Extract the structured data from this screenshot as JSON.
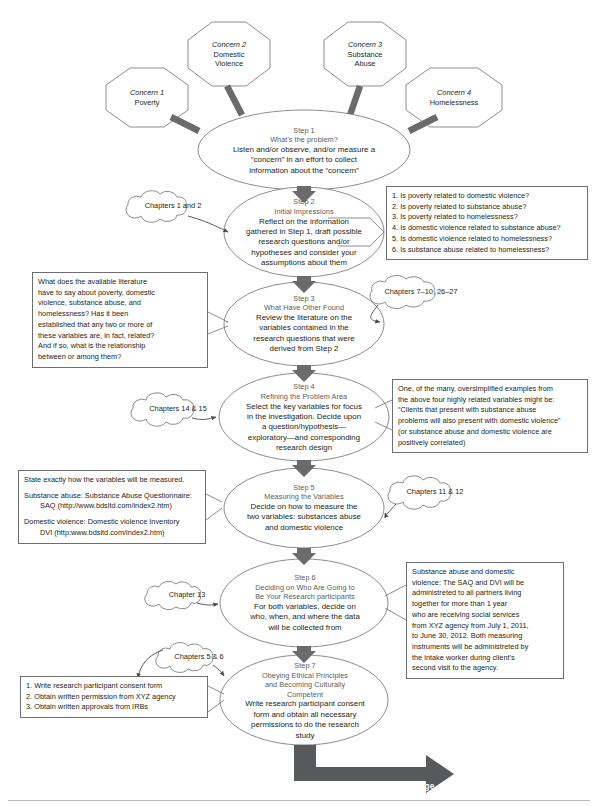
{
  "figure": {
    "type": "flowchart",
    "title_visible": false,
    "continued_label": "Continued on following page",
    "colors": {
      "outline": "#6d6e71",
      "connector": "#58595b",
      "header_text": "#5c5c5c",
      "body_text": "#231f20",
      "background": "#ffffff"
    }
  },
  "concerns": [
    {
      "id": "concern-1",
      "label_line1": "Concern 1",
      "label_line2": "Poverty"
    },
    {
      "id": "concern-2",
      "label_line1": "Concern 2",
      "label_line2": "Domestic",
      "label_line3": "Violence"
    },
    {
      "id": "concern-3",
      "label_line1": "Concern 3",
      "label_line2": "Substance",
      "label_line3": "Abuse"
    },
    {
      "id": "concern-4",
      "label_line1": "Concern 4",
      "label_line2": "Homelessness"
    }
  ],
  "steps": [
    {
      "id": "step-1",
      "number": "Step 1",
      "title": "What's the problem?",
      "body": [
        "Listen and/or observe, and/or measure a",
        "“concern” in an effort to collect",
        "information about the “concern”"
      ]
    },
    {
      "id": "step-2",
      "number": "Step 2",
      "title": "Initial Impressions",
      "body": [
        "Reflect on the information",
        "gathered in Step 1, draft possible",
        "research questions and/or",
        "hypotheses and consider your",
        "assumptions about them"
      ]
    },
    {
      "id": "step-3",
      "number": "Step 3",
      "title": "What Have Other Found",
      "body": [
        "Review the literature on the",
        "variables contained in the",
        "research questions that were",
        "derived from Step 2"
      ]
    },
    {
      "id": "step-4",
      "number": "Step 4",
      "title": "Refining the Problem Area",
      "body": [
        "Select the key variables for focus",
        "in the investigation. Decide upon",
        "a question/hypothesis—",
        "exploratory—and corresponding",
        "research design"
      ]
    },
    {
      "id": "step-5",
      "number": "Step 5",
      "title": "Measuring the Variables",
      "body": [
        "Decide on how to measure the",
        "two variables: substances abuse",
        "and domestic violence"
      ]
    },
    {
      "id": "step-6",
      "number": "Step 6",
      "title_line1": "Deciding on Who Are Going to",
      "title_line2": "Be Your Research participants",
      "body": [
        "For both variables, decide on",
        "who, when, and where the data",
        "will be collected from"
      ]
    },
    {
      "id": "step-7",
      "number": "Step 7",
      "title_line1": "Obeying Ethical Principles",
      "title_line2": "and Becoming Culturally",
      "title_line3": "Competent",
      "body": [
        "Write research participant consent",
        "form and obtain all necessary",
        "permissions to do the research",
        "study"
      ]
    }
  ],
  "chapter_clouds": [
    {
      "id": "cloud-step-2",
      "label": "Chapters 1 and 2"
    },
    {
      "id": "cloud-step-3",
      "label": "Chapters 7–10, 26–27"
    },
    {
      "id": "cloud-step-4",
      "label": "Chapters 14 & 15"
    },
    {
      "id": "cloud-step-5",
      "label": "Chapters 11 & 12"
    },
    {
      "id": "cloud-step-6",
      "label": "Chapter 13"
    },
    {
      "id": "cloud-step-7",
      "label": "Chapters 5 & 6"
    }
  ],
  "notes": {
    "research_questions": {
      "id": "note-research-questions",
      "lines": [
        "1. Is poverty related to domestic violence?",
        "2. Is poverty related to substance abuse?",
        "3. Is poverty related to homelessness?",
        "4. Is domestic violence related to substance abuse?",
        "5. Is domestic violence related to homelessness?",
        "6. Is substance abuse related to homelessness?"
      ]
    },
    "literature_question": {
      "id": "note-literature-question",
      "lines": [
        "What does the available literature",
        "have to say about poverty, domestic",
        "violence, substance abuse, and",
        "homelessness? Has it been",
        "established that any two or more of",
        "these variables are, in fact, related?",
        "And if so, what is the relationship",
        "between or among them?"
      ]
    },
    "hypothesis_example": {
      "id": "note-hypothesis-example",
      "lines": [
        "One, of the many, oversimplified examples from",
        "the above four highly related variables might be:",
        "“Clients that present with substance abuse",
        "problems will also present with domestic violence”",
        "(or substance abuse and domestic violence are",
        "positively correlated)"
      ]
    },
    "measurement": {
      "id": "note-measurement",
      "line_intro": "State exactly how the variables will be measured.",
      "sa_line1": "Substance abuse: Substance Abuse Questionnaire:",
      "sa_line2": "SAQ (http://www.bdsltd.com/index2.htm)",
      "dv_line1": "Domestic violence: Domestic violence Inventory",
      "dv_line2": "DVI (http:www.bdsltd.com/index2.htm)"
    },
    "sampling": {
      "id": "note-sampling",
      "lines": [
        "Substance abuse and domestic",
        "violence: The SAQ and DVI will be",
        "administreted to all partners living",
        "together for more than 1 year",
        "who are receiving social services",
        "from XYZ agency from July 1, 2011,",
        "to June 30, 2012. Both measuring",
        "instruments will be administreted by",
        "the intake worker during client's",
        "second visit to the agency."
      ]
    },
    "ethics": {
      "id": "note-ethics",
      "lines": [
        "1. Write research participant consent form",
        "2. Obtain written permission from XYZ agency",
        "3. Obtain written approvals from IRBs"
      ]
    }
  }
}
